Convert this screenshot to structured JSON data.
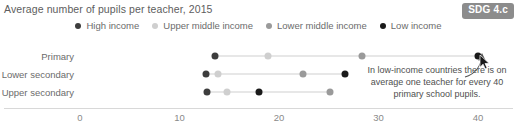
{
  "header": {
    "title": "Average number of pupils per teacher, 2015",
    "badge": "SDG 4.c"
  },
  "legend": {
    "position": "top-center",
    "items": [
      {
        "label": "High income",
        "color": "#3d3d3d"
      },
      {
        "label": "Upper middle income",
        "color": "#cfcfcf"
      },
      {
        "label": "Lower middle income",
        "color": "#9a9a9a"
      },
      {
        "label": "Low income",
        "color": "#1a1a1a"
      }
    ]
  },
  "annotation": {
    "text": "In low-income countries there is on average one teacher for every 40 primary school pupils.",
    "arrow": "curved-arrow-up-icon"
  },
  "cursor": {
    "icon": "mouse-pointer-icon",
    "x": 479,
    "y": 54
  },
  "chart_data": {
    "type": "scatter",
    "title": "Average number of pupils per teacher, 2015",
    "xlabel": "",
    "ylabel": "",
    "xlim": [
      0,
      42
    ],
    "xticks": [
      0,
      10,
      20,
      30,
      40
    ],
    "xtick_labels": [
      "0",
      "10",
      "20",
      "30",
      "40"
    ],
    "grid": false,
    "legend_position": "top-center",
    "categories": [
      "Primary",
      "Lower secondary",
      "Upper secondary"
    ],
    "series": [
      {
        "name": "High income",
        "color": "#3d3d3d",
        "values": [
          13.6,
          12.7,
          12.8
        ]
      },
      {
        "name": "Upper middle income",
        "color": "#cfcfcf",
        "values": [
          18.9,
          13.9,
          14.8
        ]
      },
      {
        "name": "Lower middle income",
        "color": "#9a9a9a",
        "values": [
          28.3,
          22.4,
          25.1
        ]
      },
      {
        "name": "Low income",
        "color": "#1a1a1a",
        "values": [
          40.0,
          26.6,
          18.0
        ]
      }
    ],
    "rows": [
      {
        "category": "Primary",
        "points": [
          {
            "series": "High income",
            "value": 13.6,
            "color": "#3d3d3d"
          },
          {
            "series": "Upper middle income",
            "value": 18.9,
            "color": "#cfcfcf"
          },
          {
            "series": "Lower middle income",
            "value": 28.3,
            "color": "#9a9a9a"
          },
          {
            "series": "Low income",
            "value": 40.0,
            "color": "#1a1a1a"
          }
        ]
      },
      {
        "category": "Lower secondary",
        "points": [
          {
            "series": "High income",
            "value": 12.7,
            "color": "#3d3d3d"
          },
          {
            "series": "Upper middle income",
            "value": 13.9,
            "color": "#cfcfcf"
          },
          {
            "series": "Lower middle income",
            "value": 22.4,
            "color": "#9a9a9a"
          },
          {
            "series": "Low income",
            "value": 26.6,
            "color": "#1a1a1a"
          }
        ]
      },
      {
        "category": "Upper secondary",
        "points": [
          {
            "series": "High income",
            "value": 12.8,
            "color": "#3d3d3d"
          },
          {
            "series": "Upper middle income",
            "value": 14.8,
            "color": "#cfcfcf"
          },
          {
            "series": "Low income",
            "value": 18.0,
            "color": "#1a1a1a"
          },
          {
            "series": "Lower middle income",
            "value": 25.1,
            "color": "#9a9a9a"
          }
        ]
      }
    ]
  }
}
